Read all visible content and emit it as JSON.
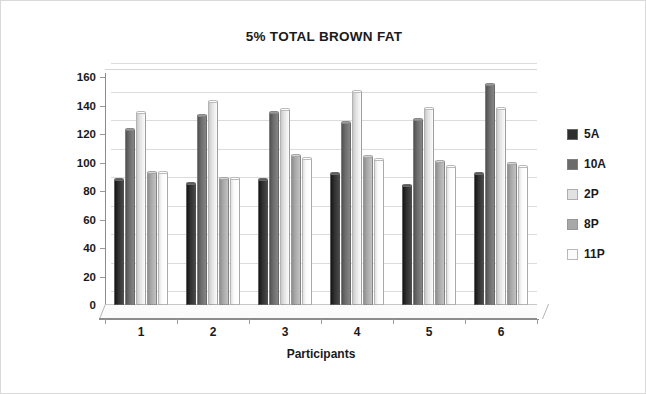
{
  "chart_data": {
    "type": "bar",
    "title": "5% TOTAL BROWN FAT",
    "xlabel": "Participants",
    "ylabel": "Blood Glucose Level",
    "categories": [
      "1",
      "2",
      "3",
      "4",
      "5",
      "6"
    ],
    "ylim": [
      0,
      160
    ],
    "ytick_step": 20,
    "yticks": [
      160,
      140,
      120,
      100,
      80,
      60,
      40,
      20,
      0
    ],
    "grid": true,
    "legend_position": "right",
    "series": [
      {
        "name": "5A",
        "color": "#2e2e2e",
        "values": [
          88,
          85,
          88,
          92,
          84,
          92
        ]
      },
      {
        "name": "10A",
        "color": "#6b6b6b",
        "values": [
          123,
          133,
          135,
          128,
          130,
          155
        ]
      },
      {
        "name": "2P",
        "color": "#e2e2e2",
        "values": [
          135,
          143,
          137,
          150,
          138,
          138
        ]
      },
      {
        "name": "8P",
        "color": "#a8a8a8",
        "values": [
          93,
          89,
          105,
          104,
          101,
          99
        ]
      },
      {
        "name": "11P",
        "color": "#fbfbfb",
        "values": [
          93,
          89,
          103,
          102,
          97,
          97
        ]
      }
    ]
  },
  "legend": {
    "items": [
      {
        "label": "5A"
      },
      {
        "label": "10A"
      },
      {
        "label": "2P"
      },
      {
        "label": "8P"
      },
      {
        "label": "11P"
      }
    ]
  }
}
